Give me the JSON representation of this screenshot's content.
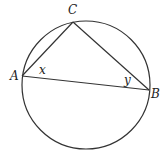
{
  "diagram": {
    "type": "inscribed-triangle-in-circle",
    "circle": {
      "cx": 86,
      "cy": 85,
      "r": 64
    },
    "points": {
      "A": {
        "label": "A",
        "x": 22,
        "y": 76
      },
      "B": {
        "label": "B",
        "x": 149,
        "y": 90
      },
      "C": {
        "label": "C",
        "x": 73,
        "y": 22
      }
    },
    "angle_labels": {
      "x": {
        "label": "x",
        "at": "A"
      },
      "y": {
        "label": "y",
        "at": "B"
      }
    },
    "stroke_color": "#333333"
  }
}
